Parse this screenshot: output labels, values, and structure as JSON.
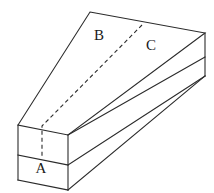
{
  "figure": {
    "background_color": "#ffffff",
    "stroke_color": "#2b2b2b",
    "label_color": "#1a1a1a",
    "stroke_width": 1.1,
    "labels": {
      "a": "A",
      "b": "B",
      "c": "C"
    },
    "label_positions": {
      "a": {
        "x": 41,
        "y": 170
      },
      "b": {
        "x": 99,
        "y": 37
      },
      "c": {
        "x": 151,
        "y": 47
      }
    },
    "geometry": {
      "top_apex": {
        "x": 90,
        "y": 12
      },
      "top_right_corner": {
        "x": 205,
        "y": 33
      },
      "right_mid_corner": {
        "x": 205,
        "y": 57
      },
      "right_bottom_corner": {
        "x": 205,
        "y": 76
      },
      "left_top_corner": {
        "x": 18,
        "y": 125
      },
      "left_mid_corner": {
        "x": 18,
        "y": 155
      },
      "left_bottom_corner": {
        "x": 18,
        "y": 180
      },
      "front_top_corner": {
        "x": 68,
        "y": 135
      },
      "front_mid_corner": {
        "x": 68,
        "y": 165
      },
      "front_bottom_corner": {
        "x": 68,
        "y": 190
      },
      "hidden_edge_start": {
        "x": 142,
        "y": 25
      },
      "hidden_edge_bend": {
        "x": 42,
        "y": 126
      },
      "hidden_edge_end": {
        "x": 42,
        "y": 156
      }
    },
    "edges": {
      "top_face_outline": "M 90 12 L 205 33 L 68 135 L 18 125 Z",
      "front_long_upper": "M 68 135 L 205 57",
      "front_long_lower": "M 68 165 L 205 76",
      "right_end_vertical": "M 205 33 L 205 76",
      "right_end_divider": "M 205 57 L 68 135",
      "left_end_vertical": "M 18 125 L 18 180",
      "left_end_divider": "M 18 155 L 68 165",
      "left_end_bottom": "M 18 180 L 68 190",
      "front_vertical": "M 68 135 L 68 190",
      "front_bottom_long": "M 68 190 L 205 76"
    },
    "hidden_edge": {
      "style": "dashed",
      "dash_pattern": "4,3",
      "path": "M 142 25 L 42 126 L 42 156"
    }
  }
}
